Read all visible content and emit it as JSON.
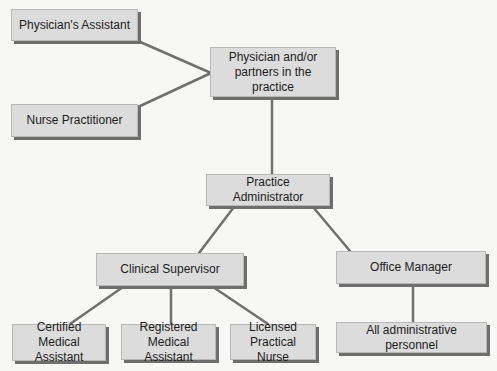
{
  "diagram": {
    "type": "org-chart",
    "line_color": "#707070",
    "node_fill": "#dcdcdc",
    "node_shadow": "#6e6e6e",
    "nodes": {
      "physicians_assistant": {
        "label": "Physician's Assistant"
      },
      "nurse_practitioner": {
        "label": "Nurse Practitioner"
      },
      "physician": {
        "label_line1": "Physician and/or",
        "label_line2": "partners in the practice"
      },
      "practice_administrator": {
        "label": "Practice Administrator"
      },
      "clinical_supervisor": {
        "label": "Clinical Supervisor"
      },
      "office_manager": {
        "label": "Office Manager"
      },
      "certified_medical_assistant": {
        "label_line1": "Certified Medical",
        "label_line2": "Assistant"
      },
      "registered_medical_assistant": {
        "label_line1": "Registered",
        "label_line2": "Medical Assistant"
      },
      "licensed_practical_nurse": {
        "label_line1": "Licensed",
        "label_line2": "Practical Nurse"
      },
      "all_administrative_personnel": {
        "label": "All administrative personnel"
      }
    },
    "edges": [
      [
        "physicians_assistant",
        "physician"
      ],
      [
        "nurse_practitioner",
        "physician"
      ],
      [
        "physician",
        "practice_administrator"
      ],
      [
        "practice_administrator",
        "clinical_supervisor"
      ],
      [
        "practice_administrator",
        "office_manager"
      ],
      [
        "clinical_supervisor",
        "certified_medical_assistant"
      ],
      [
        "clinical_supervisor",
        "registered_medical_assistant"
      ],
      [
        "clinical_supervisor",
        "licensed_practical_nurse"
      ],
      [
        "office_manager",
        "all_administrative_personnel"
      ]
    ]
  }
}
